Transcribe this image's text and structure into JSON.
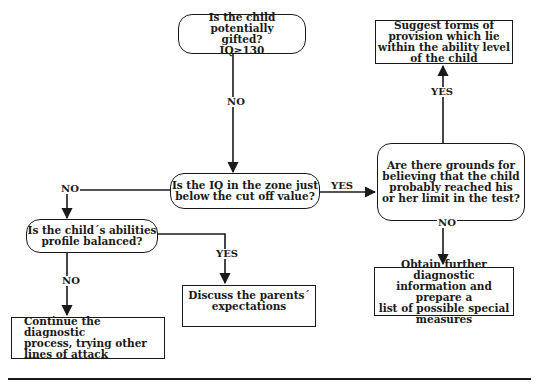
{
  "diagram": {
    "type": "flowchart",
    "nodes": {
      "gifted": {
        "shape": "decision",
        "text": "Is the child potentially\ngifted?\nIQ≥130"
      },
      "zone": {
        "shape": "decision",
        "text": "Is the IQ in the zone just\nbelow the cut off value?"
      },
      "grounds": {
        "shape": "decision",
        "text": "Are there grounds for\nbelieving that the child\nprobably reached his\nor her limit in the test?"
      },
      "suggest": {
        "shape": "process",
        "text": "Suggest forms of\nprovision which lie\nwithin the ability level\nof the child"
      },
      "balanced": {
        "shape": "decision",
        "text": "Is the child´s abilities\nprofile balanced?"
      },
      "discuss": {
        "shape": "process",
        "text": "Discuss the parents´\nexpectations"
      },
      "obtain": {
        "shape": "process",
        "text": "Obtain further diagnostic\ninformation and prepare a\nlist of possible special\nmeasures"
      },
      "continue": {
        "shape": "process",
        "text": "Continue the diagnostic\nprocess, trying other\nlines of attack"
      }
    },
    "edges": [
      {
        "from": "gifted",
        "to": "zone",
        "label": "NO"
      },
      {
        "from": "zone",
        "to": "grounds",
        "label": "YES"
      },
      {
        "from": "zone",
        "to": "balanced",
        "label": "NO"
      },
      {
        "from": "grounds",
        "to": "suggest",
        "label": "YES"
      },
      {
        "from": "grounds",
        "to": "obtain",
        "label": "NO"
      },
      {
        "from": "balanced",
        "to": "discuss",
        "label": "YES"
      },
      {
        "from": "balanced",
        "to": "continue",
        "label": "NO"
      }
    ],
    "labels": {
      "no1": "NO",
      "yes_zone": "YES",
      "no_zone": "NO",
      "yes_grounds": "YES",
      "no_grounds": "NO",
      "yes_balanced": "YES",
      "no_balanced": "NO"
    }
  }
}
